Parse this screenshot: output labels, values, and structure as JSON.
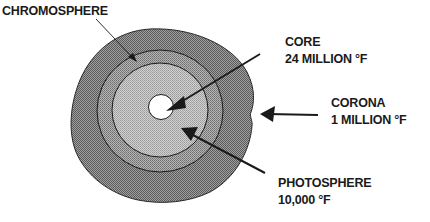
{
  "diagram": {
    "type": "sun-structure",
    "colors": {
      "corona_fill": "#8a8a8a",
      "chromosphere_fill": "#9c9c9c",
      "photosphere_fill": "#b8b8b8",
      "core_fill": "#ffffff",
      "stroke": "#1a1a1a"
    },
    "labels": {
      "chromosphere": {
        "name": "CHROMOSPHERE"
      },
      "core": {
        "name": "CORE",
        "temperature": "24 MILLION °F"
      },
      "corona": {
        "name": "CORONA",
        "temperature": "1 MILLION °F"
      },
      "photosphere": {
        "name": "PHOTOSPHERE",
        "temperature": "10,000 °F"
      }
    }
  }
}
